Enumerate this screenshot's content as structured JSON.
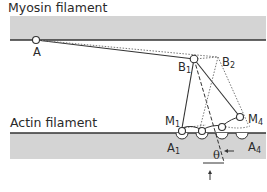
{
  "diagram": {
    "title_top": "Myosin filament",
    "title_bottom": "Actin filament",
    "points": {
      "A": "A",
      "B1": {
        "base": "B",
        "sub": "1"
      },
      "B2": {
        "base": "B",
        "sub": "2"
      },
      "M1": {
        "base": "M",
        "sub": "1"
      },
      "M4": {
        "base": "M",
        "sub": "4"
      },
      "A1": {
        "base": "A",
        "sub": "1"
      },
      "A4": {
        "base": "A",
        "sub": "4"
      }
    },
    "angle_label": "θ",
    "colors": {
      "filament_fill": "#d4d4d4",
      "line": "#333333",
      "dotted": "#777777"
    }
  }
}
